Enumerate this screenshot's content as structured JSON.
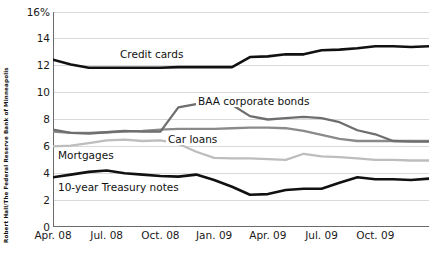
{
  "source_credit": "Robert Hall/The Federal Reserve Bank of Minneapolis",
  "axis": {
    "y_ticks": [
      "16%",
      "14",
      "12",
      "10",
      "8",
      "6",
      "4",
      "2",
      "0"
    ],
    "x_ticks": [
      "Apr. 08",
      "Jul. 08",
      "Oct. 08",
      "Jan. 09",
      "Apr. 09",
      "Jul. 09",
      "Oct. 09"
    ]
  },
  "series_labels": {
    "credit_cards": "Credit cards",
    "baa": "BAA corporate bonds",
    "car_loans": "Car loans",
    "mortgages": "Mortgages",
    "treasury": "10-year Treasury notes"
  },
  "colors": {
    "credit_cards": "#111111",
    "baa": "#6e6e6e",
    "car_loans": "#8a8a8a",
    "mortgages": "#bdbdbd",
    "treasury": "#111111",
    "grid": "#d9d9d9",
    "axis": "#6b6b6b",
    "background": "#ffffff"
  },
  "chart_data": {
    "type": "line",
    "title": "",
    "subtitle": "",
    "xlabel": "",
    "ylabel": "",
    "ylim": [
      0,
      16
    ],
    "xlim": [
      0,
      21
    ],
    "grid": true,
    "grid_axis": "y",
    "legend": "inline-labels",
    "y_tick_values": [
      0,
      2,
      4,
      6,
      8,
      10,
      12,
      14,
      16
    ],
    "y_unit": "percent",
    "x_tick_labels": [
      "Apr. 08",
      "Jul. 08",
      "Oct. 08",
      "Jan. 09",
      "Apr. 09",
      "Jul. 09",
      "Oct. 09"
    ],
    "x_tick_positions": [
      0,
      3,
      6,
      9,
      12,
      15,
      18
    ],
    "x": [
      "Apr. 08",
      "May 08",
      "Jun. 08",
      "Jul. 08",
      "Aug. 08",
      "Sep. 08",
      "Oct. 08",
      "Nov. 08",
      "Dec. 08",
      "Jan. 09",
      "Feb. 09",
      "Mar. 09",
      "Apr. 09",
      "May 09",
      "Jun. 09",
      "Jul. 09",
      "Aug. 09",
      "Sep. 09",
      "Oct. 09",
      "Nov. 09",
      "Dec. 09",
      "Jan. 10"
    ],
    "series": [
      {
        "name": "Credit cards",
        "color": "#111111",
        "width": 2.6,
        "values": [
          12.45,
          12.1,
          11.85,
          11.85,
          11.85,
          11.85,
          11.85,
          11.9,
          11.9,
          11.9,
          11.9,
          12.65,
          12.7,
          12.85,
          12.85,
          13.15,
          13.2,
          13.3,
          13.45,
          13.45,
          13.4,
          13.45
        ]
      },
      {
        "name": "BAA corporate bonds",
        "color": "#6e6e6e",
        "width": 2.3,
        "values": [
          7.25,
          7.0,
          6.95,
          7.05,
          7.15,
          7.1,
          7.1,
          8.9,
          9.15,
          9.2,
          9.1,
          8.25,
          8.0,
          8.1,
          8.2,
          8.1,
          7.8,
          7.2,
          6.9,
          6.4,
          6.35,
          6.35
        ]
      },
      {
        "name": "Car loans",
        "color": "#8a8a8a",
        "width": 2.3,
        "values": [
          7.1,
          7.0,
          7.0,
          7.05,
          7.1,
          7.15,
          7.25,
          7.3,
          7.3,
          7.3,
          7.35,
          7.4,
          7.4,
          7.35,
          7.15,
          6.85,
          6.55,
          6.4,
          6.4,
          6.4,
          6.4,
          6.4
        ]
      },
      {
        "name": "Mortgages",
        "color": "#bdbdbd",
        "width": 2.3,
        "values": [
          6.0,
          6.05,
          6.25,
          6.45,
          6.5,
          6.4,
          6.45,
          6.2,
          5.6,
          5.15,
          5.1,
          5.1,
          5.05,
          5.0,
          5.45,
          5.25,
          5.2,
          5.1,
          5.0,
          5.0,
          4.95,
          4.95
        ]
      },
      {
        "name": "10-year Treasury notes",
        "color": "#111111",
        "width": 2.6,
        "values": [
          3.7,
          3.9,
          4.1,
          4.2,
          4.0,
          3.9,
          3.8,
          3.75,
          3.9,
          3.5,
          3.0,
          2.4,
          2.45,
          2.75,
          2.85,
          2.85,
          3.3,
          3.7,
          3.55,
          3.55,
          3.5,
          3.6
        ]
      }
    ]
  }
}
